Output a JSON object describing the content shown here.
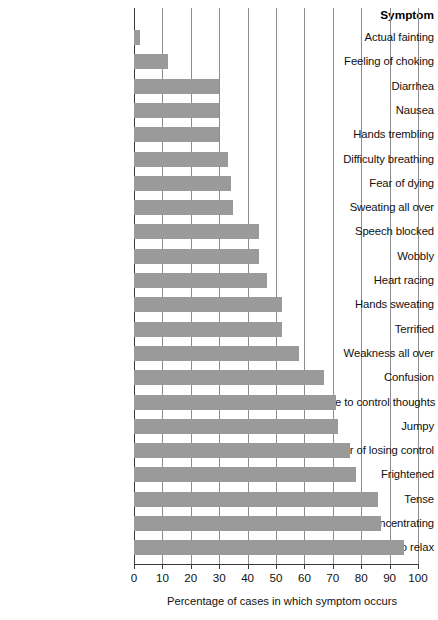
{
  "chart_data": {
    "type": "bar",
    "orientation": "horizontal",
    "title": "",
    "xlabel": "Percentage of cases in which symptom occurs",
    "ylabel": "Symptom",
    "xlim": [
      0,
      100
    ],
    "xticks": [
      0,
      10,
      20,
      30,
      40,
      50,
      60,
      70,
      80,
      90,
      100
    ],
    "xtick_labels": [
      "0",
      "10",
      "20",
      "30",
      "40",
      "50",
      "60",
      "70",
      "80",
      "90",
      "100"
    ],
    "grid": true,
    "grid_axis": "x",
    "legend": false,
    "bar_color": "#9a9a9a",
    "categories": [
      "Actual fainting",
      "Feeling of choking",
      "Diarrhea",
      "Nausea",
      "Hands trembling",
      "Difficulty breathing",
      "Fear of dying",
      "Sweating all over",
      "Speech blocked",
      "Wobbly",
      "Heart racing",
      "Hands sweating",
      "Terrified",
      "Weakness all over",
      "Confusion",
      "Unable to control thoughts",
      "Jumpy",
      "Fear of losing control",
      "Frightened",
      "Tense",
      "Difficulty concentrating",
      "Unable to relax"
    ],
    "values": [
      2,
      12,
      30,
      30,
      30,
      33,
      34,
      35,
      44,
      44,
      47,
      52,
      52,
      58,
      67,
      71,
      72,
      76,
      78,
      86,
      87,
      95
    ]
  },
  "header": {
    "column_label": "Symptom"
  },
  "axis": {
    "title": "Percentage of cases in which symptom occurs"
  }
}
